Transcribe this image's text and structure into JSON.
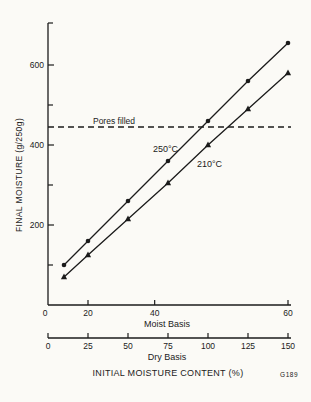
{
  "figure": {
    "code_label": "G189",
    "ink_color": "#1b1b1b",
    "paper_color": "#fbfaf6"
  },
  "chart_data": {
    "type": "line",
    "title": "",
    "ylabel": "FINAL MOISTURE (g/250g)",
    "xlabel": "INITIAL MOISTURE CONTENT (%)",
    "ylim": [
      0,
      700
    ],
    "y_ticks_major": [
      200,
      400,
      600
    ],
    "y_ticks_minor": [
      100,
      300,
      500
    ],
    "grid": "off",
    "x_axes": [
      {
        "name": "Moist Basis",
        "ticks": [
          0,
          20,
          40,
          60
        ],
        "note": "nonlinear companion scale of dry basis"
      },
      {
        "name": "Dry Basis",
        "ticks": [
          0,
          25,
          50,
          75,
          100,
          125,
          150
        ],
        "note": "linear scale"
      }
    ],
    "x_dry_basis": [
      10,
      25,
      50,
      75,
      100,
      125,
      150
    ],
    "series": [
      {
        "name": "250°C",
        "marker": "circle",
        "values": [
          100,
          160,
          260,
          360,
          460,
          560,
          655
        ]
      },
      {
        "name": "210°C",
        "marker": "triangle",
        "values": [
          70,
          125,
          215,
          305,
          400,
          490,
          580
        ]
      }
    ],
    "reference_line": {
      "label": "Pores filled",
      "value": 445,
      "style": "dashed"
    }
  }
}
